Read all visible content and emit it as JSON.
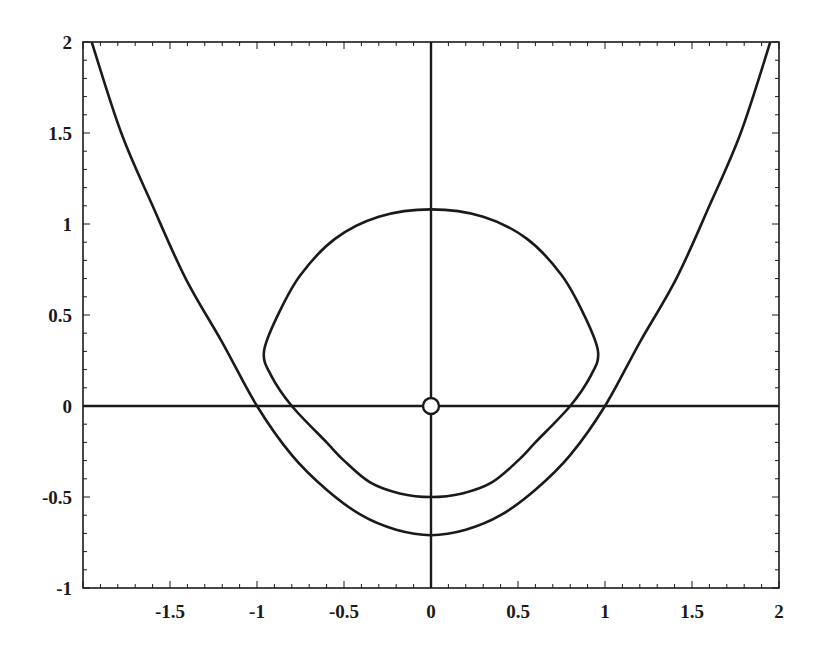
{
  "chart_data": {
    "type": "line",
    "title": "",
    "xlabel": "",
    "ylabel": "",
    "xlim": [
      -2,
      2
    ],
    "ylim": [
      -1,
      2
    ],
    "grid": false,
    "legend": null,
    "x_ticks": [
      "-1.5",
      "-1",
      "-0.5",
      "0",
      "0.5",
      "1",
      "1.5",
      "2"
    ],
    "y_ticks": [
      "2",
      "1.5",
      "1",
      "0.5",
      "0",
      "-0.5",
      "-1"
    ],
    "x_tick_values": [
      -1.5,
      -1,
      -0.5,
      0,
      0.5,
      1,
      1.5,
      2
    ],
    "y_tick_values": [
      2,
      1.5,
      1,
      0.5,
      0,
      -0.5,
      -1
    ],
    "axes_lines": {
      "x_axis_at_y": 0,
      "y_axis_at_x": 0
    },
    "annotations": [
      {
        "type": "open-circle-marker",
        "x": 0,
        "y": 0
      }
    ],
    "series": [
      {
        "name": "outer-parabola-curve",
        "closed": false,
        "points": [
          [
            -1.95,
            2.0
          ],
          [
            -1.78,
            1.5
          ],
          [
            -1.6,
            1.1
          ],
          [
            -1.41,
            0.7
          ],
          [
            -1.2,
            0.35
          ],
          [
            -1.0,
            0.0
          ],
          [
            -0.8,
            -0.27
          ],
          [
            -0.6,
            -0.46
          ],
          [
            -0.4,
            -0.6
          ],
          [
            -0.2,
            -0.68
          ],
          [
            0.0,
            -0.71
          ],
          [
            0.2,
            -0.68
          ],
          [
            0.4,
            -0.6
          ],
          [
            0.6,
            -0.46
          ],
          [
            0.8,
            -0.27
          ],
          [
            1.0,
            0.0
          ],
          [
            1.2,
            0.35
          ],
          [
            1.41,
            0.7
          ],
          [
            1.6,
            1.1
          ],
          [
            1.78,
            1.5
          ],
          [
            1.95,
            2.0
          ]
        ]
      },
      {
        "name": "closed-curve",
        "closed": true,
        "points": [
          [
            0.0,
            1.08
          ],
          [
            0.3,
            1.04
          ],
          [
            0.55,
            0.92
          ],
          [
            0.75,
            0.72
          ],
          [
            0.88,
            0.5
          ],
          [
            0.96,
            0.3
          ],
          [
            0.92,
            0.17
          ],
          [
            0.8,
            0.0
          ],
          [
            0.6,
            -0.2
          ],
          [
            0.5,
            -0.3
          ],
          [
            0.35,
            -0.42
          ],
          [
            0.18,
            -0.48
          ],
          [
            0.0,
            -0.5
          ],
          [
            -0.18,
            -0.48
          ],
          [
            -0.35,
            -0.42
          ],
          [
            -0.5,
            -0.3
          ],
          [
            -0.6,
            -0.2
          ],
          [
            -0.8,
            0.0
          ],
          [
            -0.92,
            0.17
          ],
          [
            -0.96,
            0.3
          ],
          [
            -0.88,
            0.5
          ],
          [
            -0.75,
            0.72
          ],
          [
            -0.55,
            0.92
          ],
          [
            -0.3,
            1.04
          ]
        ]
      }
    ]
  },
  "colors": {
    "line": "#1a1a1a",
    "background": "#ffffff"
  }
}
